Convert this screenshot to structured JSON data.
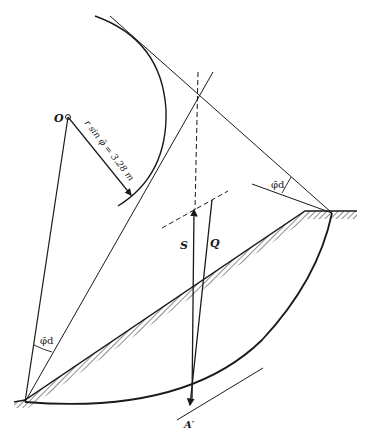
{
  "diagram": {
    "type": "slope-stability-friction-circle",
    "labels": {
      "center": "O",
      "radius_note": "r sin φ̄ = 3.28 m",
      "phi_top": "φ̄d",
      "phi_bottom": "φ̄d",
      "force_s": "S",
      "force_q": "Q",
      "point_a": "A′"
    },
    "colors": {
      "line": "#1a1a1a",
      "background": "#ffffff"
    }
  }
}
